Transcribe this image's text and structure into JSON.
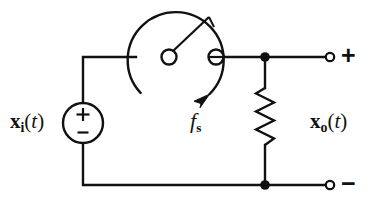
{
  "figure": {
    "type": "circuit-schematic",
    "width": 384,
    "height": 199,
    "background_color": "#ffffff",
    "line_color": "#111111"
  },
  "labels": {
    "input_signal": {
      "var": "x",
      "sub": "i",
      "open_paren": "(",
      "arg": "t",
      "close_paren": ")",
      "full_text": "x_i(t)"
    },
    "output_signal": {
      "var": "x",
      "sub": "o",
      "open_paren": "(",
      "arg": "t",
      "close_paren": ")",
      "full_text": "x_o(t)"
    },
    "sampling_frequency": {
      "var": "f",
      "sub": "s",
      "full_text": "f_s"
    },
    "terminal_positive": "+",
    "terminal_negative": "−"
  },
  "components": {
    "voltage_source": {
      "name": "input-voltage-source",
      "shape": "circle",
      "center_x": 83,
      "center_y": 123,
      "radius": 20,
      "plus_mark": "+",
      "minus_mark": "−"
    },
    "rotating_switch": {
      "name": "rotating-sampling-switch",
      "dial_center_x": 169,
      "dial_center_y": 57,
      "dial_radius": 48,
      "pivot_x": 169,
      "pivot_y": 57,
      "pivot_radius": 7,
      "contact_x": 216,
      "contact_y": 57,
      "contact_radius": 7,
      "arm_tip_x": 208,
      "arm_tip_y": 17,
      "rotation_direction": "clockwise"
    },
    "resistor": {
      "name": "load-resistor",
      "shape": "zigzag",
      "x": 265,
      "top_y": 88,
      "bottom_y": 145,
      "amplitude": 9,
      "segments": 6
    },
    "node_top": {
      "x": 265,
      "y": 57,
      "radius": 4.5
    },
    "node_bottom": {
      "x": 265,
      "y": 185,
      "radius": 4.5
    },
    "terminal_top": {
      "x": 330,
      "y": 57,
      "radius": 4
    },
    "terminal_bottom": {
      "x": 330,
      "y": 185,
      "radius": 4
    }
  },
  "wires": [
    {
      "name": "source-to-switch-left",
      "points": "83,103 83,57 128,57"
    },
    {
      "name": "switch-contact-to-node",
      "points": "223,57 265,57"
    },
    {
      "name": "node-to-terminal-top",
      "points": "265,57 326,57"
    },
    {
      "name": "node-to-resistor-top",
      "points": "265,61 265,88"
    },
    {
      "name": "resistor-to-node-bottom",
      "points": "265,145 265,185"
    },
    {
      "name": "source-to-bottom-rail",
      "points": "83,143 83,185 265,185"
    },
    {
      "name": "node-bottom-to-terminal",
      "points": "265,185 326,185"
    }
  ]
}
